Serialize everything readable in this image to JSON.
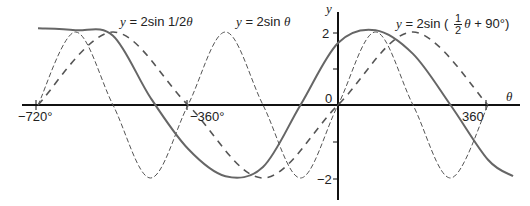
{
  "chart_data": {
    "type": "line",
    "title": "",
    "xlabel": "θ",
    "ylabel": "y",
    "xlim": [
      -720,
      380
    ],
    "ylim": [
      -2.6,
      2.6
    ],
    "x_ticks": [
      -720,
      -360,
      0,
      360
    ],
    "x_tick_labels": [
      "−720°",
      "−360°",
      "0",
      "360"
    ],
    "y_ticks": [
      -2,
      -1,
      1,
      2
    ],
    "y_tick_labels": [
      "−2",
      "",
      "",
      "2"
    ],
    "grid": false,
    "legend": "inline labels",
    "series": [
      {
        "name": "y = 2sin θ",
        "style": "thin-dashed",
        "x": [
          -720,
          -630,
          -540,
          -450,
          -360,
          -270,
          -180,
          -90,
          0,
          90,
          180,
          270,
          360
        ],
        "values": [
          0,
          2,
          0,
          -2,
          0,
          2,
          0,
          -2,
          0,
          2,
          0,
          -2,
          0
        ]
      },
      {
        "name": "y = 2sin 1/2θ",
        "style": "thick-dashed",
        "x": [
          -720,
          -540,
          -360,
          -180,
          0,
          180,
          360
        ],
        "values": [
          0,
          2,
          0,
          -2,
          0,
          2,
          0
        ]
      },
      {
        "name": "y = 2sin (1/2 θ + 90°)",
        "style": "solid",
        "x": [
          -720,
          -630,
          -540,
          -450,
          -360,
          -270,
          -180,
          -90,
          0,
          90,
          180,
          270,
          360,
          420
        ],
        "values": [
          2.1,
          2.05,
          1.9,
          0.2,
          -1.2,
          -1.95,
          -1.7,
          0,
          1.7,
          2.05,
          1.4,
          0,
          -1.5,
          -1.95
        ]
      }
    ]
  },
  "labels": {
    "y_axis": "y",
    "x_axis": "θ",
    "origin": "0",
    "tick_x_neg720": "−720°",
    "tick_x_neg360": "−360°",
    "tick_x_360": "360",
    "tick_y_2": "2",
    "tick_y_neg2": "−2",
    "curve_half": {
      "prefix": "y",
      "eq": " = 2sin 1/2",
      "var": "θ"
    },
    "curve_full": {
      "prefix": "y",
      "eq": " = 2sin ",
      "var": "θ"
    },
    "curve_shift": {
      "prefix": "y",
      "eq": " = 2sin ( ",
      "num": "1",
      "den": "2",
      "var": "θ",
      "tail": " + 90°)"
    }
  }
}
